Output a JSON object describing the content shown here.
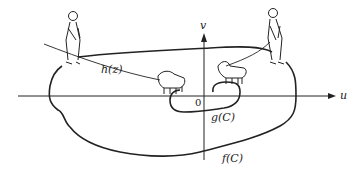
{
  "diagram": {
    "labels": {
      "h": "h(z)",
      "g": "g(C)",
      "f": "f(C)",
      "origin": "0",
      "u_axis": "u",
      "v_axis": "v"
    },
    "figures": [
      "walker-left",
      "walker-right",
      "dog-left",
      "dog-right"
    ],
    "colors": {
      "ink": "#222222",
      "background": "#ffffff"
    }
  }
}
